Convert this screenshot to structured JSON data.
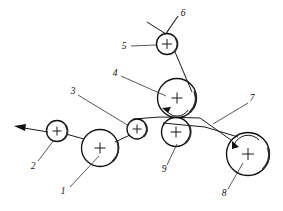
{
  "figure": {
    "background_color": "#ffffff",
    "line_color": "#111111",
    "label_color": "#111111"
  },
  "callouts": [
    {
      "id": "1",
      "label": "1",
      "x": 66,
      "y": 192,
      "refers_to": "main-nip-roller-large-left"
    },
    {
      "id": "2",
      "label": "2",
      "x": 35,
      "y": 167,
      "refers_to": "exit-guide-roller-small-left"
    },
    {
      "id": "3",
      "label": "3",
      "x": 73,
      "y": 92,
      "refers_to": "idler-roller-small-center"
    },
    {
      "id": "4",
      "label": "4",
      "x": 115,
      "y": 74,
      "refers_to": "drive-roller-large-upper"
    },
    {
      "id": "5",
      "label": "5",
      "x": 124,
      "y": 47,
      "refers_to": "top-guide-roller-small"
    },
    {
      "id": "6",
      "label": "6",
      "x": 183,
      "y": 14,
      "refers_to": "incoming-web-strand"
    },
    {
      "id": "7",
      "label": "7",
      "x": 252,
      "y": 99,
      "refers_to": "transfer-web-strand-right"
    },
    {
      "id": "8",
      "label": "8",
      "x": 224,
      "y": 194,
      "refers_to": "wind-up-roller-large-right"
    },
    {
      "id": "9",
      "label": "9",
      "x": 164,
      "y": 170,
      "refers_to": "pressure-roller-lower-center"
    }
  ],
  "rollers": [
    {
      "name": "exit-guide-roller-small-left",
      "callout": "2",
      "cx": 57,
      "cy": 131,
      "r": 10.5,
      "size": "small"
    },
    {
      "name": "main-nip-roller-large-left",
      "callout": "1",
      "cx": 100,
      "cy": 148,
      "r": 18.5,
      "size": "large"
    },
    {
      "name": "idler-roller-small-center",
      "callout": "3",
      "cx": 137,
      "cy": 129,
      "r": 10.0,
      "size": "small"
    },
    {
      "name": "drive-roller-large-upper",
      "callout": "4",
      "cx": 177,
      "cy": 98,
      "r": 19.5,
      "size": "large"
    },
    {
      "name": "pressure-roller-lower-center",
      "callout": "9",
      "cx": 176,
      "cy": 132,
      "r": 14.5,
      "size": "medium"
    },
    {
      "name": "top-guide-roller-small",
      "callout": "5",
      "cx": 167,
      "cy": 44,
      "r": 10.5,
      "size": "small"
    },
    {
      "name": "wind-up-roller-large-right",
      "callout": "8",
      "cx": 248,
      "cy": 154,
      "r": 21.5,
      "size": "large"
    }
  ],
  "rotation_arrows": [
    {
      "name": "rotation-arrow-drive-roller",
      "roller": "drive-roller-large-upper",
      "direction": "counter-clockwise"
    },
    {
      "name": "rotation-arrow-wind-up-roller",
      "roller": "wind-up-roller-large-right",
      "direction": "clockwise"
    }
  ],
  "web_strands": [
    {
      "name": "incoming-web-strand",
      "callout": "6"
    },
    {
      "name": "web-strand-five-to-four",
      "callout": ""
    },
    {
      "name": "web-strand-main-horizontal",
      "callout": ""
    },
    {
      "name": "transfer-web-strand-right",
      "callout": "7"
    },
    {
      "name": "exit-web-strand-left",
      "callout": "2"
    }
  ]
}
